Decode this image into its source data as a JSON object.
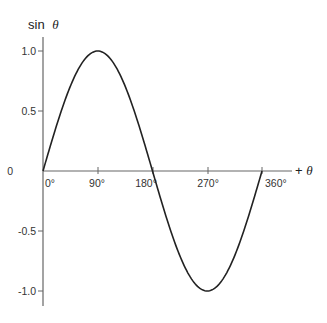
{
  "chart_data": {
    "type": "line",
    "title": "",
    "xlabel": "+θ",
    "ylabel": "sin θ",
    "ylabel_parts": {
      "text": "sin",
      "symbol": "θ"
    },
    "xlabel_parts": {
      "sign": "+",
      "symbol": "θ"
    },
    "x_ticks": [
      "0°",
      "90°",
      "180°",
      "270°",
      "360°"
    ],
    "y_ticks": [
      "1.0",
      "0.5",
      "0",
      "-0.5",
      "-1.0"
    ],
    "x_tick_values": [
      0,
      90,
      180,
      270,
      360
    ],
    "y_tick_values": [
      1.0,
      0.5,
      0,
      -0.5,
      -1.0
    ],
    "xlim": [
      0,
      360
    ],
    "ylim": [
      -1.1,
      1.1
    ],
    "grid": false,
    "legend": null,
    "series": [
      {
        "name": "sin θ",
        "function": "sin",
        "x": [
          0,
          30,
          60,
          90,
          120,
          150,
          180,
          210,
          240,
          270,
          300,
          330,
          360
        ],
        "values": [
          0,
          0.5,
          0.866,
          1.0,
          0.866,
          0.5,
          0,
          -0.5,
          -0.866,
          -1.0,
          -0.866,
          -0.5,
          0
        ],
        "color": "#222222"
      }
    ]
  },
  "colors": {
    "axis": "#666666",
    "curve": "#222222",
    "text": "#333333"
  }
}
